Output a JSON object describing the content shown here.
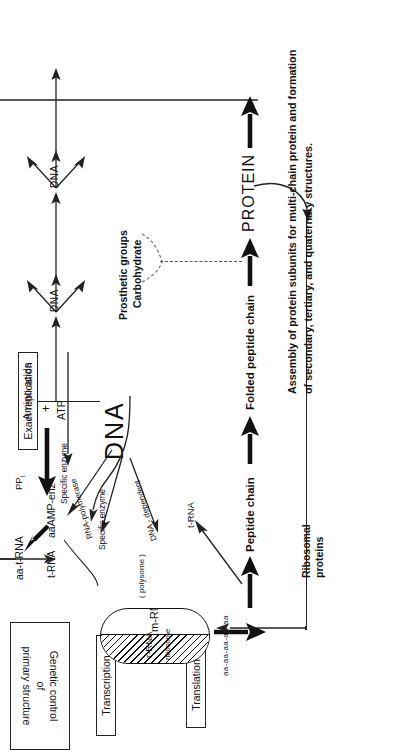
{
  "figure": {
    "orientation": "rotated-90",
    "ink": "#111111",
    "paper": "#ffffff"
  },
  "boxes": {
    "genetic_control": "Genetic control\nof\nprimary structure",
    "transcription": "Transcription",
    "translation": "Translation",
    "exact_replication": "Exact replication"
  },
  "nodes": {
    "dna": "DNA",
    "dna_1": "DNA",
    "dna_2": "DNA",
    "m_rna": "m-RNA",
    "r_rna": "r-RNA",
    "ribosome": "ribosome",
    "polysome": "( polysome )",
    "t_rna_left": "t-RNA",
    "t_rna_right": "t-RNA",
    "aa_amp_enz": "aaAMP-enz",
    "aa_t_rna": "aa-t-RNA",
    "amino_acids": "Amino acids",
    "plus": "+",
    "atp": "ATP",
    "ppi": "PP",
    "ppi_sub": "i",
    "peptide_chain": "Peptide  chain",
    "folded_peptide_chain": "Folded peptide  chain",
    "protein": "PROTEIN",
    "ribosomal_proteins": "Ribosomal\nproteins",
    "chain_beads": "aa-aa-aa-aa-aa"
  },
  "edge_labels": {
    "dna_dependent": "DNA - dependent",
    "rna_polymerase": "RNA-polymerase",
    "specific_enzyme_1": "Specific  enzyme",
    "specific_enzyme_2": "Specific  enzyme"
  },
  "annotations": {
    "prosthetic_groups": "Prosthetic groups",
    "carbohydrate": "Carbohydrate",
    "assembly_line1": "Assembly of protein subunits for multi-chain protein and formation",
    "assembly_line2": "of secondary, tertiary, and quaternary structures."
  }
}
